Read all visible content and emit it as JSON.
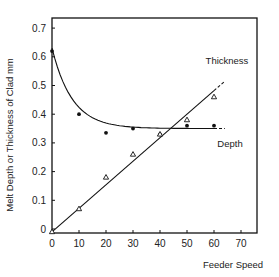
{
  "chart_data": {
    "type": "line",
    "title": "",
    "xlabel": "Feeder Speed",
    "ylabel": "Melt Depth or Thickness of Clad   mm",
    "xlim": [
      0,
      76
    ],
    "ylim": [
      -0.02,
      0.73
    ],
    "x_ticks": [
      0,
      10,
      20,
      30,
      40,
      50,
      60,
      70
    ],
    "x_tick_labels": [
      "0",
      "10",
      "20",
      "30",
      "40",
      "50",
      "60",
      "70"
    ],
    "y_ticks": [
      0,
      0.1,
      0.2,
      0.3,
      0.4,
      0.5,
      0.6,
      0.7
    ],
    "y_tick_labels": [
      "0",
      "0.1",
      "0.2",
      "0.3",
      "0.4",
      "0.5",
      "0.6",
      "0.7"
    ],
    "grid": false,
    "series": [
      {
        "name": "Thickness",
        "marker": "filled-circle",
        "points": [
          [
            0,
            0.62
          ],
          [
            10,
            0.4
          ],
          [
            20,
            0.335
          ],
          [
            30,
            0.35
          ],
          [
            40,
            0.33
          ],
          [
            50,
            0.36
          ],
          [
            60,
            0.36
          ]
        ],
        "fit_curve": "exponential decay to ~0.35",
        "label_position": "upper-right"
      },
      {
        "name": "Depth",
        "marker": "open-triangle",
        "points": [
          [
            0,
            -0.01
          ],
          [
            10,
            0.07
          ],
          [
            20,
            0.18
          ],
          [
            30,
            0.26
          ],
          [
            40,
            0.33
          ],
          [
            50,
            0.38
          ],
          [
            60,
            0.46
          ]
        ],
        "fit_line": {
          "slope": 0.0082,
          "intercept": -0.01
        },
        "label_position": "lower-right"
      }
    ]
  }
}
